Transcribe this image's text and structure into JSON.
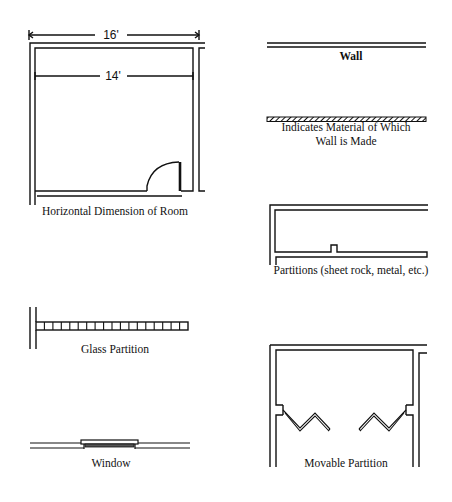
{
  "colors": {
    "ink": "#111111",
    "background": "#ffffff"
  },
  "room": {
    "outer_dimension": "16'",
    "inner_dimension": "14'",
    "caption": "Horizontal Dimension of Room"
  },
  "wall": {
    "caption": "Wall"
  },
  "material": {
    "caption_line1": "Indicates Material of Which",
    "caption_line2": "Wall is Made"
  },
  "partitions": {
    "caption": "Partitions (sheet rock, metal, etc.)"
  },
  "glass_partition": {
    "caption": "Glass Partition",
    "cell_count": 18
  },
  "window": {
    "caption": "Window"
  },
  "movable_partition": {
    "caption": "Movable Partition"
  }
}
